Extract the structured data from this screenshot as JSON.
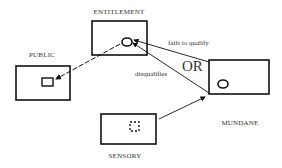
{
  "diagram": {
    "nodes": [
      {
        "id": "entitlement",
        "label": "ENTITLEMENT",
        "inner_shape": "circle"
      },
      {
        "id": "public",
        "label": "PUBLIC",
        "inner_shape": "square"
      },
      {
        "id": "mundane",
        "label": "MUNDANE",
        "inner_shape": "circle"
      },
      {
        "id": "sensory",
        "label": "SENSORY",
        "inner_shape": "dashed-square"
      }
    ],
    "edges": [
      {
        "from": "entitlement",
        "to": "public",
        "label": "",
        "style": "dashed"
      },
      {
        "from": "mundane",
        "to": "entitlement",
        "label": "fails to qualify",
        "style": "solid"
      },
      {
        "from": "mundane",
        "to": "entitlement",
        "label": "disqualifies",
        "style": "solid"
      },
      {
        "from": "sensory",
        "to": "mundane",
        "label": "",
        "style": "solid"
      }
    ],
    "connector_label": "OR",
    "colors": {
      "stroke": "#111111",
      "text": "#333333",
      "background": "#ffffff"
    }
  }
}
